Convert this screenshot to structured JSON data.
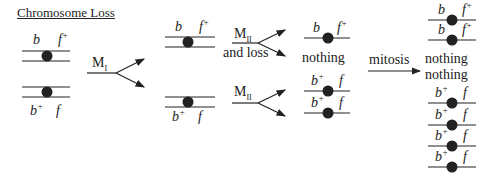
{
  "title": "Chromosome Loss",
  "alleles": {
    "b": "b",
    "f": "f",
    "plus": "+"
  },
  "stages": {
    "meiosis1": {
      "label": "M",
      "sub": "I"
    },
    "meiosis2_loss": {
      "label": "M",
      "sub": "II",
      "extra": "and loss"
    },
    "meiosis2": {
      "label": "M",
      "sub": "II"
    },
    "mitosis": {
      "label": "mitosis"
    }
  },
  "outcomes": {
    "nothing": "nothing"
  },
  "colors": {
    "ink": "#222222",
    "background": "#ffffff"
  }
}
